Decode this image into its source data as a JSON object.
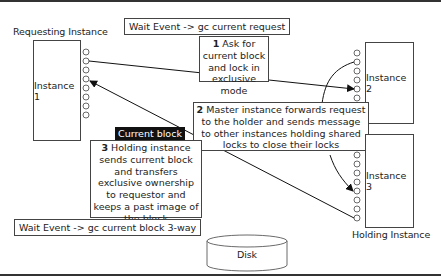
{
  "diagram": {
    "labels": {
      "requesting_instance": "Requesting Instance",
      "holding_instance": "Holding Instance"
    },
    "instances": [
      {
        "id": "instance-1",
        "label": "Instance 1"
      },
      {
        "id": "instance-2",
        "label": "Instance 2"
      },
      {
        "id": "instance-3",
        "label": "Instance 3"
      }
    ],
    "wait_events": {
      "top": "Wait Event -> gc current request",
      "bottom": "Wait Event -> gc current block 3-way"
    },
    "steps": [
      {
        "number": "1",
        "text": "Ask for current block and lock in exclusive mode"
      },
      {
        "number": "2",
        "text": "Master instance forwards request to the holder and sends message to other instances holding shared locks to close their locks"
      },
      {
        "number": "3",
        "text": "Holding instance sends current block and transfers exclusive ownership to requestor and keeps a past image of the block"
      }
    ],
    "current_block_tag": "Current block",
    "disk_label": "Disk"
  }
}
